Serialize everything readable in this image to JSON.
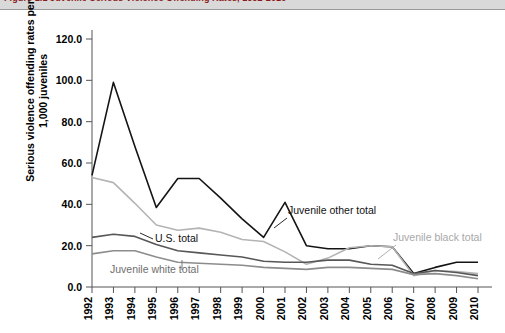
{
  "caption": {
    "figure_label": "Figure 1.1  Juvenile Serious Violence Offending Rates, 1992-2010",
    "right_note": ""
  },
  "chart_data": {
    "type": "line",
    "title": "",
    "xlabel": "",
    "ylabel": "Serious violence offending rates per 1,000 juveniles",
    "ylim": [
      0.0,
      120.0
    ],
    "yticks": [
      "0.0",
      "20.0",
      "40.0",
      "60.0",
      "80.0",
      "100.0",
      "120.0"
    ],
    "ytick_values": [
      0,
      20,
      40,
      60,
      80,
      100,
      120
    ],
    "grid": false,
    "legend_position": "inline-annotations",
    "categories": [
      "1992",
      "1993",
      "1994",
      "1995",
      "1996",
      "1997",
      "1998",
      "1999",
      "2000",
      "2001",
      "2002",
      "2003",
      "2004",
      "2005",
      "2006",
      "2007",
      "2008",
      "2009",
      "2010"
    ],
    "series": [
      {
        "name": "Juvenile other total",
        "color": "#141414",
        "values": [
          54.0,
          99.0,
          68.0,
          38.5,
          52.5,
          52.5,
          43.0,
          33.0,
          24.0,
          41.0,
          20.0,
          18.5,
          18.5,
          20.0,
          19.5,
          6.5,
          9.5,
          12.0,
          12.0
        ]
      },
      {
        "name": "Juvenile black total",
        "color": "#b4b4b4",
        "values": [
          53.0,
          50.5,
          40.5,
          30.0,
          27.5,
          28.5,
          26.5,
          23.0,
          22.0,
          17.0,
          11.0,
          14.0,
          19.0,
          20.0,
          19.5,
          5.5,
          8.0,
          7.5,
          6.5
        ]
      },
      {
        "name": "U.S. total",
        "color": "#575757",
        "values": [
          24.0,
          25.5,
          24.5,
          20.5,
          17.5,
          16.5,
          15.5,
          14.5,
          12.5,
          12.0,
          12.0,
          13.0,
          13.0,
          11.0,
          10.5,
          6.5,
          8.0,
          7.0,
          5.5
        ]
      },
      {
        "name": "Juvenile white total",
        "color": "#8c8c8c",
        "values": [
          16.0,
          17.5,
          17.5,
          14.5,
          12.0,
          11.5,
          11.0,
          10.5,
          9.5,
          9.0,
          8.5,
          9.5,
          9.5,
          9.0,
          8.5,
          6.0,
          6.5,
          5.5,
          4.0
        ]
      }
    ],
    "annotations": [
      {
        "text": "Juvenile other total",
        "color": "#111111"
      },
      {
        "text": "Juvenile black total",
        "color": "#a8a8a8"
      },
      {
        "text": "U.S. total",
        "color": "#111111"
      },
      {
        "text": "Juvenile white total",
        "color": "#6e6e6e"
      }
    ]
  }
}
